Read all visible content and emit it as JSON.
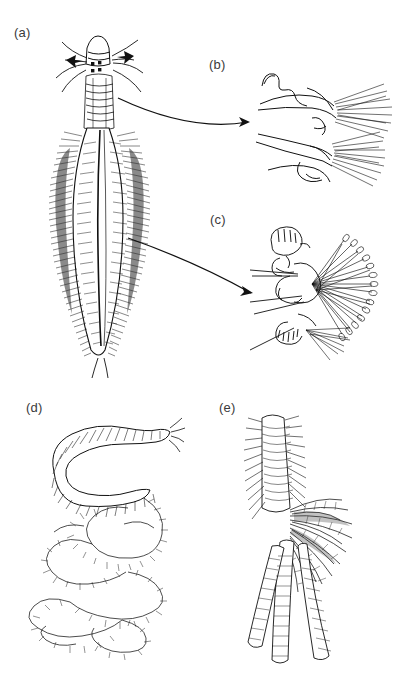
{
  "figure": {
    "background_color": "#ffffff",
    "ink_color": "#1a1a1a",
    "label_color": "#3a3a3a",
    "width": 407,
    "height": 696,
    "type": "scientific-line-illustration-plate"
  },
  "panels": [
    {
      "id": "a",
      "label": "(a)",
      "label_x": 14,
      "label_y": 25,
      "caption_text": "(a)",
      "description": "whole scale-less polychaete worm, dorsal view, head with palps, antennae and four eyespots, body with dense dark lateral chaetal fringes and pale mid-dorsal line, two anal cirri"
    },
    {
      "id": "b",
      "label": "(b)",
      "label_x": 209,
      "label_y": 57,
      "caption_text": "(b)",
      "description": "enlarged anterior parapodium outline with fine chaetal fans"
    },
    {
      "id": "c",
      "label": "(c)",
      "label_x": 210,
      "label_y": 212,
      "caption_text": "(c)",
      "description": "enlarged mid-body parapodium with radiating fan of paddle-tipped chaetae and long aciculae"
    },
    {
      "id": "d",
      "label": "(d)",
      "label_x": 26,
      "label_y": 400,
      "caption_text": "(d)",
      "description": "coiled worm with thick annulated anterior trunk and long beaded moniliform posterior coils"
    },
    {
      "id": "e",
      "label": "(e)",
      "label_x": 219,
      "label_y": 400,
      "caption_text": "(e)",
      "description": "worm with segmented trunk bearing a dense tuft of branchial filaments and trailing ventral appendages"
    }
  ],
  "leader_arrows": [
    {
      "name": "arrow-a-to-b",
      "from_x": 118,
      "from_y": 98,
      "ctrl_x": 190,
      "ctrl_y": 132,
      "to_x": 250,
      "to_y": 122,
      "links": "a-to-b"
    },
    {
      "name": "arrow-a-to-c",
      "from_x": 128,
      "from_y": 238,
      "ctrl_x": 196,
      "ctrl_y": 262,
      "to_x": 253,
      "to_y": 293,
      "links": "a-to-c"
    }
  ]
}
